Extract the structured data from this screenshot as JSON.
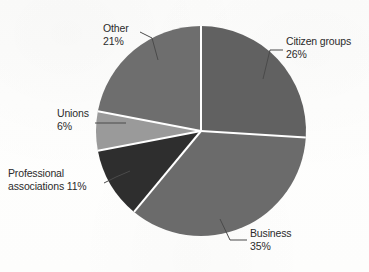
{
  "chart_data": {
    "type": "pie",
    "title": "",
    "subtitle": "",
    "xlabel": "",
    "ylabel": "",
    "legend_position": "callout-labels",
    "grid": false,
    "unit": "%",
    "total": 99,
    "categories": [
      "Citizen groups",
      "Business",
      "Professional associations",
      "Unions",
      "Other"
    ],
    "values": [
      26,
      35,
      11,
      6,
      21
    ],
    "slices": [
      {
        "name": "Citizen groups",
        "label_line1": "Citizen groups",
        "label_line2": "26%",
        "value": 26,
        "value_text": "26%",
        "color": "#616161",
        "start_angle_deg": 0,
        "end_angle_deg": 93.6
      },
      {
        "name": "Business",
        "label_line1": "Business",
        "label_line2": "35%",
        "value": 35,
        "value_text": "35%",
        "color": "#6b6b6b",
        "start_angle_deg": 93.6,
        "end_angle_deg": 219.6
      },
      {
        "name": "Professional associations",
        "label_line1": "Professional",
        "label_line2": "associations 11%",
        "value": 11,
        "value_text": "11%",
        "color": "#2e2e2e",
        "start_angle_deg": 219.6,
        "end_angle_deg": 259.2
      },
      {
        "name": "Unions",
        "label_line1": "Unions",
        "label_line2": "6%",
        "value": 6,
        "value_text": "6%",
        "color": "#9a9a9a",
        "start_angle_deg": 259.2,
        "end_angle_deg": 280.8
      },
      {
        "name": "Other",
        "label_line1": "Other",
        "label_line2": "21%",
        "value": 21,
        "value_text": "21%",
        "color": "#6e6e6e",
        "start_angle_deg": 280.8,
        "end_angle_deg": 360
      }
    ],
    "geometry": {
      "center_x": 201,
      "center_y": 131,
      "radius": 105,
      "separator_color": "#ffffff",
      "separator_width": 2
    },
    "background_color": "#fdfdfc",
    "text_color": "#2b2b2b",
    "leader_line_color": "#4a4a4a"
  }
}
